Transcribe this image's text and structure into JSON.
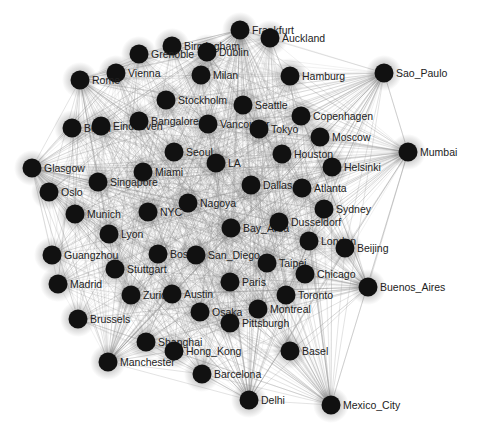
{
  "graph": {
    "type": "directed-network",
    "colors": {
      "background": "#ffffff",
      "node_fill": "#111111",
      "edge": "#8a8a8a",
      "label": "#222222"
    },
    "nodes": [
      {
        "id": "Frankfurt",
        "label": "Frankfurt",
        "x": 240,
        "y": 30
      },
      {
        "id": "Auckland",
        "label": "Auckland",
        "x": 270,
        "y": 38
      },
      {
        "id": "Birmingham",
        "label": "Birmingham",
        "x": 172,
        "y": 46
      },
      {
        "id": "Dublin",
        "label": "Dublin",
        "x": 207,
        "y": 52
      },
      {
        "id": "Grenoble",
        "label": "Grenoble",
        "x": 139,
        "y": 54
      },
      {
        "id": "Vienna",
        "label": "Vienna",
        "x": 116,
        "y": 73
      },
      {
        "id": "Milan",
        "label": "Milan",
        "x": 201,
        "y": 75
      },
      {
        "id": "Rome",
        "label": "Rome",
        "x": 80,
        "y": 80
      },
      {
        "id": "Hamburg",
        "label": "Hamburg",
        "x": 290,
        "y": 76
      },
      {
        "id": "Sao_Paulo",
        "label": "Sao_Paulo",
        "x": 384,
        "y": 73
      },
      {
        "id": "Stockholm",
        "label": "Stockholm",
        "x": 166,
        "y": 100
      },
      {
        "id": "Seattle",
        "label": "Seattle",
        "x": 243,
        "y": 105
      },
      {
        "id": "Copenhagen",
        "label": "Copenhagen",
        "x": 301,
        "y": 116
      },
      {
        "id": "Berlin",
        "label": "Berlin",
        "x": 72,
        "y": 128
      },
      {
        "id": "Eindhoven",
        "label": "Eindhoven",
        "x": 101,
        "y": 126
      },
      {
        "id": "Bangalore",
        "label": "Bangalore",
        "x": 139,
        "y": 121
      },
      {
        "id": "Vancouver",
        "label": "Vancouver",
        "x": 208,
        "y": 124
      },
      {
        "id": "Tokyo",
        "label": "Tokyo",
        "x": 259,
        "y": 129
      },
      {
        "id": "Moscow",
        "label": "Moscow",
        "x": 320,
        "y": 137
      },
      {
        "id": "Mumbai",
        "label": "Mumbai",
        "x": 408,
        "y": 152
      },
      {
        "id": "Seoul",
        "label": "Seoul",
        "x": 174,
        "y": 152
      },
      {
        "id": "Houston",
        "label": "Houston",
        "x": 282,
        "y": 154
      },
      {
        "id": "LA",
        "label": "LA",
        "x": 216,
        "y": 163
      },
      {
        "id": "Helsinki",
        "label": "Helsinki",
        "x": 332,
        "y": 167
      },
      {
        "id": "Glasgow",
        "label": "Glasgow",
        "x": 32,
        "y": 168
      },
      {
        "id": "Miami",
        "label": "Miami",
        "x": 143,
        "y": 172
      },
      {
        "id": "Singapore",
        "label": "Singapore",
        "x": 98,
        "y": 182
      },
      {
        "id": "Oslo",
        "label": "Oslo",
        "x": 49,
        "y": 192
      },
      {
        "id": "Dallas",
        "label": "Dallas",
        "x": 251,
        "y": 185
      },
      {
        "id": "Atlanta",
        "label": "Atlanta",
        "x": 302,
        "y": 188
      },
      {
        "id": "Nagoya",
        "label": "Nagoya",
        "x": 188,
        "y": 203
      },
      {
        "id": "NYC",
        "label": "NYC",
        "x": 148,
        "y": 212
      },
      {
        "id": "Munich",
        "label": "Munich",
        "x": 75,
        "y": 214
      },
      {
        "id": "Sydney",
        "label": "Sydney",
        "x": 324,
        "y": 209
      },
      {
        "id": "Bay_Area",
        "label": "Bay_Area",
        "x": 231,
        "y": 228
      },
      {
        "id": "Dusseldorf",
        "label": "Dusseldorf",
        "x": 279,
        "y": 222
      },
      {
        "id": "Lyon",
        "label": "Lyon",
        "x": 109,
        "y": 234
      },
      {
        "id": "London",
        "label": "London",
        "x": 309,
        "y": 241
      },
      {
        "id": "Beijing",
        "label": "Beijing",
        "x": 345,
        "y": 248
      },
      {
        "id": "Guangzhou",
        "label": "Guangzhou",
        "x": 52,
        "y": 255
      },
      {
        "id": "Boston",
        "label": "Boston",
        "x": 158,
        "y": 254
      },
      {
        "id": "San_Diego",
        "label": "San_Diego",
        "x": 196,
        "y": 255
      },
      {
        "id": "Taipei",
        "label": "Taipei",
        "x": 267,
        "y": 263
      },
      {
        "id": "Stuttgart",
        "label": "Stuttgart",
        "x": 115,
        "y": 269
      },
      {
        "id": "Chicago",
        "label": "Chicago",
        "x": 305,
        "y": 274
      },
      {
        "id": "Madrid",
        "label": "Madrid",
        "x": 58,
        "y": 284
      },
      {
        "id": "Paris",
        "label": "Paris",
        "x": 230,
        "y": 282
      },
      {
        "id": "Buenos_Aires",
        "label": "Buenos_Aires",
        "x": 368,
        "y": 287
      },
      {
        "id": "Zurich",
        "label": "Zurich",
        "x": 131,
        "y": 295
      },
      {
        "id": "Austin",
        "label": "Austin",
        "x": 172,
        "y": 294
      },
      {
        "id": "Toronto",
        "label": "Toronto",
        "x": 286,
        "y": 295
      },
      {
        "id": "Brussels",
        "label": "Brussels",
        "x": 78,
        "y": 319
      },
      {
        "id": "Osaka",
        "label": "Osaka",
        "x": 200,
        "y": 312
      },
      {
        "id": "Montreal",
        "label": "Montreal",
        "x": 258,
        "y": 309
      },
      {
        "id": "Pittsburgh",
        "label": "Pittsburgh",
        "x": 230,
        "y": 323
      },
      {
        "id": "Shanghai",
        "label": "Shanghai",
        "x": 146,
        "y": 342
      },
      {
        "id": "Hong_Kong",
        "label": "Hong_Kong",
        "x": 174,
        "y": 351
      },
      {
        "id": "Basel",
        "label": "Basel",
        "x": 290,
        "y": 351
      },
      {
        "id": "Manchester",
        "label": "Manchester",
        "x": 108,
        "y": 362
      },
      {
        "id": "Barcelona",
        "label": "Barcelona",
        "x": 202,
        "y": 374
      },
      {
        "id": "Delhi",
        "label": "Delhi",
        "x": 249,
        "y": 400
      },
      {
        "id": "Mexico_City",
        "label": "Mexico_City",
        "x": 331,
        "y": 405
      }
    ],
    "peripheral_hubs": [
      "Sao_Paulo",
      "Mumbai",
      "Buenos_Aires",
      "Mexico_City",
      "Delhi",
      "Manchester",
      "Glasgow",
      "Rome",
      "Frankfurt"
    ]
  }
}
